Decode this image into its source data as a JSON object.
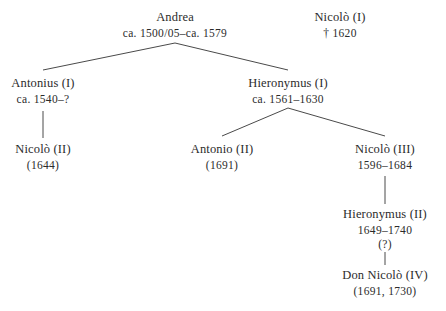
{
  "diagram": {
    "background_color": "#ffffff",
    "text_color": "#2b2b2b",
    "line_color": "#4a4a4a",
    "nodes": [
      {
        "id": "andrea",
        "name": "Andrea",
        "dates": "ca. 1500/05–ca. 1579",
        "note": "",
        "x": 175,
        "y": 10
      },
      {
        "id": "nicolo-1",
        "name": "Nicolò (I)",
        "dates": "† 1620",
        "note": "",
        "x": 340,
        "y": 10
      },
      {
        "id": "antonius-1",
        "name": "Antonius (I)",
        "dates": "ca. 1540–?",
        "note": "",
        "x": 43,
        "y": 76
      },
      {
        "id": "hieronymus-1",
        "name": "Hieronymus (I)",
        "dates": "ca. 1561–1630",
        "note": "",
        "x": 288,
        "y": 76
      },
      {
        "id": "nicolo-2",
        "name": "Nicolò (II)",
        "dates": "(1644)",
        "note": "",
        "x": 43,
        "y": 142
      },
      {
        "id": "antonio-2",
        "name": "Antonio (II)",
        "dates": "(1691)",
        "note": "",
        "x": 222,
        "y": 142
      },
      {
        "id": "nicolo-3",
        "name": "Nicolò (III)",
        "dates": "1596–1684",
        "note": "",
        "x": 385,
        "y": 142
      },
      {
        "id": "hieronymus-2",
        "name": "Hieronymus (II)",
        "dates": "1649–1740",
        "note": "(?)",
        "x": 385,
        "y": 207
      },
      {
        "id": "don-nicolo-4",
        "name": "Don Nicolò (IV)",
        "dates": "(1691, 1730)",
        "note": "",
        "x": 385,
        "y": 268
      }
    ],
    "connectors": [
      {
        "id": "andrea-to-antonius-1",
        "type": "diagonal",
        "x1": 175,
        "y1": 43,
        "x2": 43,
        "y2": 70
      },
      {
        "id": "andrea-to-hieronymus-1",
        "type": "diagonal",
        "x1": 175,
        "y1": 43,
        "x2": 288,
        "y2": 70
      },
      {
        "id": "antonius-1-to-nicolo-2",
        "type": "vertical",
        "x1": 43,
        "y1": 111,
        "x2": 43,
        "y2": 138
      },
      {
        "id": "hieronymus-1-to-antonio-2",
        "type": "diagonal",
        "x1": 288,
        "y1": 108,
        "x2": 222,
        "y2": 136
      },
      {
        "id": "hieronymus-1-to-nicolo-3",
        "type": "diagonal",
        "x1": 288,
        "y1": 108,
        "x2": 385,
        "y2": 136
      },
      {
        "id": "nicolo-3-to-hieronymus-2",
        "type": "vertical",
        "x1": 385,
        "y1": 176,
        "x2": 385,
        "y2": 204
      },
      {
        "id": "hieronymus-2-to-don-nicolo-4",
        "type": "vertical",
        "x1": 385,
        "y1": 252,
        "x2": 385,
        "y2": 265
      }
    ]
  }
}
